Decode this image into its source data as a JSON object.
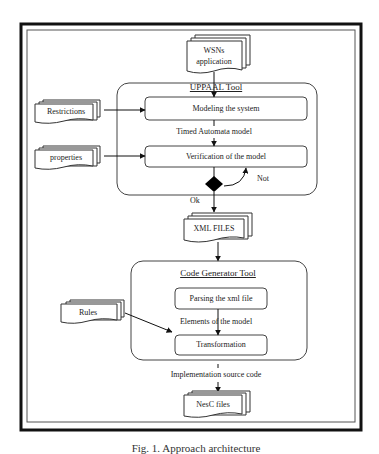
{
  "diagram": {
    "caption": "Fig. 1. Approach architecture",
    "inputs": {
      "wsn_application": [
        "WSNs",
        "application"
      ],
      "restrictions": "Restrictions",
      "properties": "properties",
      "rules": "Rules"
    },
    "uppaal_tool": {
      "title": "UPPAAL Tool",
      "steps": [
        "Modeling the system",
        "Verification  of the model"
      ],
      "edge_label": "Timed Automata model",
      "decision_no": "Not"
    },
    "ok_label": "Ok",
    "xml_files": "XML FILES",
    "code_generator_tool": {
      "title": "Code Generator Tool",
      "steps": [
        "Parsing the xml file",
        "Transformation"
      ],
      "edge_label": "Elements of the model"
    },
    "output_edge_label": "Implementation source code",
    "output": "NesC files"
  },
  "colors": {
    "stroke": "#333333",
    "frame": "#111111",
    "background": "#ffffff"
  }
}
